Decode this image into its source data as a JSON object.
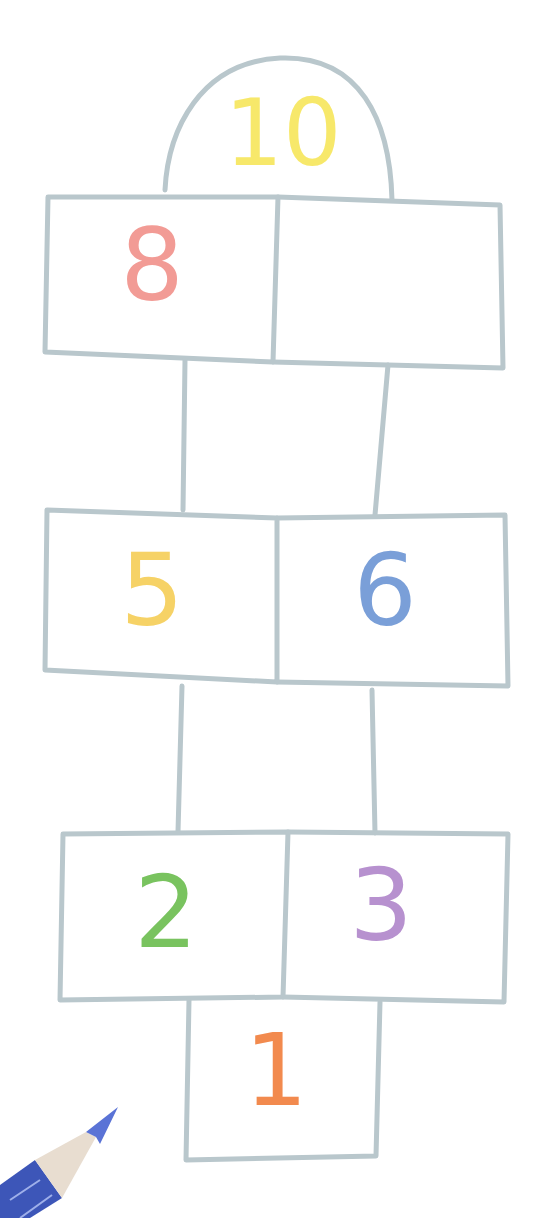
{
  "illustration": {
    "subject": "hopscotch court",
    "line_color": "#b9c7cc",
    "background": "#ffffff"
  },
  "squares": [
    {
      "id": "1",
      "label": "1",
      "color": "#f28a4e"
    },
    {
      "id": "2",
      "label": "2",
      "color": "#79c35f"
    },
    {
      "id": "3",
      "label": "3",
      "color": "#b791cf"
    },
    {
      "id": "4",
      "label": "",
      "color": ""
    },
    {
      "id": "5",
      "label": "5",
      "color": "#f6d266"
    },
    {
      "id": "6",
      "label": "6",
      "color": "#7a9fd8"
    },
    {
      "id": "7",
      "label": "",
      "color": ""
    },
    {
      "id": "8",
      "label": "8",
      "color": "#f29b95"
    },
    {
      "id": "9",
      "label": "",
      "color": ""
    },
    {
      "id": "10",
      "label": "10",
      "color": "#f7e86a"
    }
  ],
  "pencil": {
    "color": "#3d56b8",
    "tip_color": "#5a73d6",
    "wood_color": "#e8ddd0"
  }
}
